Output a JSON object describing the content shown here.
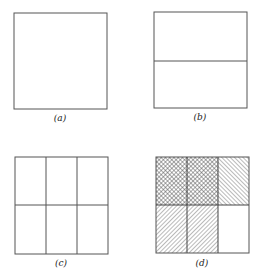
{
  "panels": [
    {
      "id": "a",
      "caption": "(a)",
      "rows": 1,
      "cols": 1,
      "fills": [
        [
          "none"
        ]
      ]
    },
    {
      "id": "b",
      "caption": "(b)",
      "rows": 2,
      "cols": 1,
      "fills": [
        [
          "none"
        ],
        [
          "none"
        ]
      ]
    },
    {
      "id": "c",
      "caption": "(c)",
      "rows": 2,
      "cols": 3,
      "fills": [
        [
          "none",
          "none",
          "none"
        ],
        [
          "none",
          "none",
          "none"
        ]
      ]
    },
    {
      "id": "d",
      "caption": "(d)",
      "rows": 2,
      "cols": 3,
      "fills": [
        [
          "crosshatch",
          "crosshatch",
          "hatch-backslash"
        ],
        [
          "hatch-slash",
          "hatch-slash",
          "none"
        ]
      ]
    }
  ],
  "colors": {
    "line": "#555555",
    "hatch": "#666666",
    "background": "#ffffff"
  }
}
